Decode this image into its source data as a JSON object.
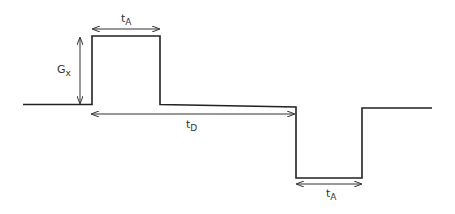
{
  "diagram": {
    "type": "gradient pulse waveform",
    "labels": {
      "amplitude": {
        "main": "G",
        "sub": "x"
      },
      "pulse_width_top": {
        "main": "t",
        "sub": "A"
      },
      "delay": {
        "main": "t",
        "sub": "D"
      },
      "pulse_width_bottom": {
        "main": "t",
        "sub": "A"
      }
    },
    "colors": {
      "line": "#222222",
      "background": "#ffffff"
    }
  }
}
